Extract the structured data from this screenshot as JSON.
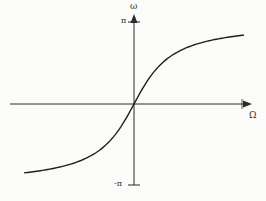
{
  "chart_data": {
    "type": "line",
    "title": "",
    "xlabel": "Ω",
    "ylabel": "ω",
    "y_ticks": [
      "π",
      "-π"
    ],
    "ylim": [
      -3.14159,
      3.14159
    ],
    "grid": false,
    "legend": null,
    "series": [
      {
        "name": "ω = 2·arctan(Ω)",
        "x": [
          -3.9,
          -3.0,
          -2.0,
          -1.5,
          -1.0,
          -0.5,
          0,
          0.5,
          1.0,
          1.5,
          2.0,
          3.0,
          3.9
        ],
        "values": [
          -2.64,
          -2.5,
          -2.21,
          -1.97,
          -1.57,
          -0.93,
          0,
          0.93,
          1.57,
          1.97,
          2.21,
          2.5,
          2.64
        ]
      }
    ]
  },
  "labels": {
    "x_axis": "Ω",
    "y_axis": "ω",
    "y_top_tick": "π",
    "y_bottom_tick": "-π"
  }
}
